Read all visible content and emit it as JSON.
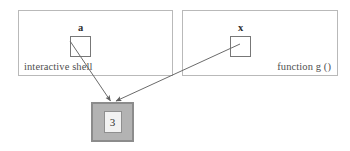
{
  "diagram": {
    "title_text_visible": false,
    "frames": [
      {
        "id": "interactive-shell",
        "label": "interactive shell",
        "variable": {
          "name": "a"
        }
      },
      {
        "id": "function-g",
        "label": "function g ()",
        "variable": {
          "name": "x"
        }
      }
    ],
    "heap_object": {
      "value": "3"
    },
    "colors": {
      "frame_border": "#b9b9b9",
      "slot_border": "#777777",
      "object_fill": "#b3b3b3",
      "object_border": "#8c8c8c",
      "value_fill": "#f2f2f2",
      "value_border": "#8f8f8f",
      "arrow": "#6b6b6b",
      "text": "#4f4f4f",
      "background": "#ffffff"
    },
    "arrows": [
      {
        "id": "a-to-object",
        "from": "a",
        "to": "heap-object"
      },
      {
        "id": "x-to-object",
        "from": "x",
        "to": "heap-object"
      }
    ]
  }
}
